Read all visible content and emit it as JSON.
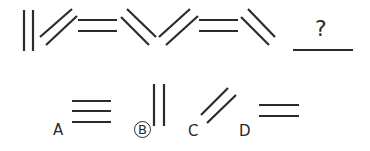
{
  "puzzle": {
    "type": "figure-sequence",
    "question_mark": "?",
    "sequence": [
      {
        "index": 1,
        "figure": "two-vertical-lines"
      },
      {
        "index": 2,
        "figure": "two-forward-slash-lines"
      },
      {
        "index": 3,
        "figure": "two-horizontal-lines"
      },
      {
        "index": 4,
        "figure": "two-back-slash-lines"
      },
      {
        "index": 5,
        "figure": "two-forward-slash-lines"
      },
      {
        "index": 6,
        "figure": "two-horizontal-lines"
      },
      {
        "index": 7,
        "figure": "two-back-slash-lines"
      },
      {
        "index": 8,
        "figure": "blank-answer-slot"
      }
    ],
    "options": [
      {
        "label": "A",
        "figure": "three-horizontal-lines",
        "selected": false
      },
      {
        "label": "B",
        "figure": "two-vertical-lines",
        "selected": true
      },
      {
        "label": "C",
        "figure": "two-forward-slash-lines",
        "selected": false
      },
      {
        "label": "D",
        "figure": "two-horizontal-lines",
        "selected": false
      }
    ],
    "colors": {
      "ink": "#2b2b2b",
      "background": "#ffffff"
    }
  }
}
